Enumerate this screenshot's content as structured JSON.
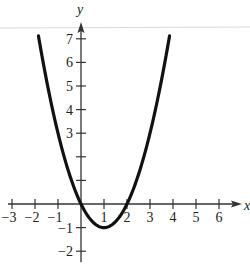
{
  "chart_data": {
    "type": "line",
    "title": "",
    "function": "y = x^2 - 2x",
    "xlabel": "x",
    "ylabel": "y",
    "xlim": [
      -3,
      6.5
    ],
    "ylim": [
      -2.3,
      7.6
    ],
    "x_ticks": [
      -3,
      -2,
      -1,
      1,
      2,
      3,
      4,
      5,
      6
    ],
    "x_tick_labels": [
      "−3",
      "−2",
      "−1",
      "1",
      "2",
      "3",
      "4",
      "5",
      "6"
    ],
    "y_ticks": [
      -2,
      -1,
      1,
      2,
      3,
      4,
      5,
      6,
      7
    ],
    "y_tick_labels": [
      "−2",
      "−1",
      "",
      "",
      "3",
      "4",
      "5",
      "6",
      "7"
    ],
    "grid": false,
    "legend": null,
    "series": [
      {
        "name": "parabola",
        "x": [
          -1.8,
          -1.5,
          -1,
          -0.5,
          0,
          0.5,
          1,
          1.5,
          2,
          2.5,
          3,
          3.5,
          3.8
        ],
        "y": [
          6.84,
          5.25,
          3,
          1.25,
          0,
          -0.75,
          -1,
          -0.75,
          0,
          1.25,
          3,
          5.25,
          6.84
        ],
        "color": "#111111"
      }
    ],
    "key_points": {
      "vertex": [
        1,
        -1
      ],
      "x_intercepts": [
        0,
        2
      ],
      "y_intercept": 0
    }
  },
  "colors": {
    "curve": "#111111",
    "axis": "#333333",
    "top_rule": "#d9d9d9"
  }
}
